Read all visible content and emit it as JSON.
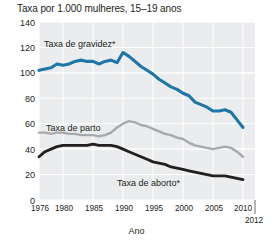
{
  "chart_data": {
    "type": "line",
    "title": "Taxa por 1.000 mulheres, 15–19 anos",
    "xlabel": "Ano",
    "ylabel": "Taxa por 1.000 mulheres, 15–19 anos",
    "xlim": [
      1976,
      2012
    ],
    "ylim": [
      0,
      140
    ],
    "grid": true,
    "legend_position": "inline-annotation",
    "yticks": [
      0,
      20,
      40,
      60,
      80,
      100,
      120,
      140
    ],
    "ytick_labels": [
      "0",
      "20",
      "40",
      "60",
      "80",
      "100",
      "120",
      "140"
    ],
    "xticks": [
      1976,
      1980,
      1985,
      1990,
      1995,
      2000,
      2005,
      2010,
      2012
    ],
    "xtick_labels": [
      "1976",
      "1980",
      "1985",
      "1990",
      "1995",
      "2000",
      "2005",
      "2010",
      "2012"
    ],
    "x": [
      1976,
      1977,
      1978,
      1979,
      1980,
      1981,
      1982,
      1983,
      1984,
      1985,
      1986,
      1987,
      1988,
      1989,
      1990,
      1991,
      1992,
      1993,
      1994,
      1995,
      1996,
      1997,
      1998,
      1999,
      2000,
      2001,
      2002,
      2003,
      2004,
      2005,
      2006,
      2007,
      2008,
      2009,
      2010
    ],
    "series": [
      {
        "name": "Taxa de gravidez*",
        "color": "#1f77a8",
        "values": [
          102,
          103,
          104,
          107,
          106,
          107,
          109,
          110,
          109,
          109,
          107,
          109,
          110,
          108,
          116,
          113,
          109,
          105,
          102,
          99,
          95,
          92,
          89,
          87,
          84,
          82,
          77,
          75,
          73,
          70,
          70,
          71,
          69,
          63,
          57
        ]
      },
      {
        "name": "Taxa de parto",
        "color": "#a7a9ac",
        "values": [
          53,
          53,
          52,
          53,
          53,
          52,
          52,
          51,
          51,
          51,
          50,
          51,
          53,
          57,
          60,
          62,
          61,
          59,
          58,
          56,
          54,
          52,
          51,
          49,
          48,
          45,
          43,
          42,
          41,
          40,
          41,
          42,
          41,
          38,
          34
        ]
      },
      {
        "name": "Taxa de aborto*",
        "color": "#231f20",
        "values": [
          34,
          38,
          40,
          42,
          43,
          43,
          43,
          43,
          43,
          44,
          43,
          43,
          43,
          42,
          40,
          38,
          36,
          34,
          32,
          30,
          29,
          28,
          26,
          25,
          24,
          23,
          22,
          21,
          20,
          19,
          19,
          19,
          18,
          17,
          16
        ]
      }
    ],
    "annotations": [
      {
        "text": "Taxa de gravidez*",
        "x_px": 44,
        "y_px": 47
      },
      {
        "text": "Taxa de parto",
        "x_px": 46,
        "y_px": 131
      },
      {
        "text": "Taxa de aborto*",
        "x_px": 117,
        "y_px": 186
      }
    ],
    "footnote_marker": "*",
    "colors": {
      "pregnancy": "#1f77a8",
      "birth": "#a7a9ac",
      "abortion": "#231f20",
      "plot_background": "#eaecee",
      "gridline": "#ffffff"
    }
  }
}
